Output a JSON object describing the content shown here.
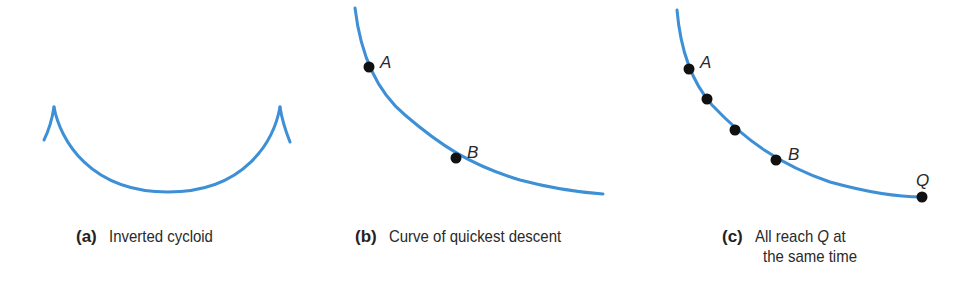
{
  "panels": [
    {
      "id": "a",
      "tag": "(a)",
      "caption": "Inverted cycloid",
      "points": []
    },
    {
      "id": "b",
      "tag": "(b)",
      "caption": "Curve of quickest descent",
      "points": [
        {
          "label": "A"
        },
        {
          "label": "B"
        }
      ]
    },
    {
      "id": "c",
      "tag": "(c)",
      "caption_line1_prefix": "All reach ",
      "caption_line1_var": "Q",
      "caption_line1_suffix": " at",
      "caption_line2": "the same time",
      "points": [
        {
          "label": "A"
        },
        {
          "label": ""
        },
        {
          "label": ""
        },
        {
          "label": "B"
        },
        {
          "label": "Q"
        }
      ]
    }
  ],
  "colors": {
    "curve": "#3d8fd6",
    "dot": "#111111",
    "text": "#2a2a2a"
  }
}
